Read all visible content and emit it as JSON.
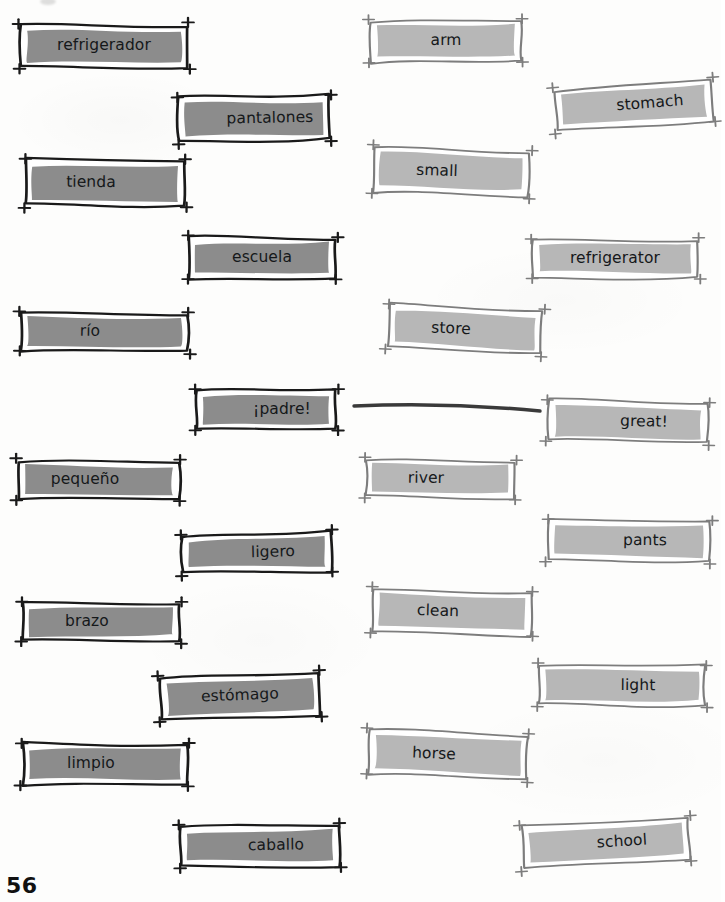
{
  "page": {
    "number": "56",
    "paper_color": "#fdfdfc",
    "spanish_card_fill": "#8c8c8c",
    "spanish_card_border": "#1a1a1a",
    "english_card_fill": "#b7b7b7",
    "english_card_border": "#7d7d7d",
    "card_inner_highlight": "#ffffff",
    "text_color": "#15181a",
    "match_line_color": "#3a3a3a"
  },
  "spanish_cards": [
    {
      "label": "refrigerador",
      "x": 10,
      "y": 16,
      "w": 188,
      "h": 60,
      "rot": 0,
      "text_shift": ""
    },
    {
      "label": "pantalones",
      "x": 168,
      "y": 88,
      "w": 172,
      "h": 62,
      "rot": -1.2,
      "text_shift": "shift-r"
    },
    {
      "label": "tienda",
      "x": 15,
      "y": 151,
      "w": 180,
      "h": 64,
      "rot": 0.4,
      "text_shift": "shift-l"
    },
    {
      "label": "escuela",
      "x": 178,
      "y": 229,
      "w": 168,
      "h": 58,
      "rot": 0,
      "text_shift": ""
    },
    {
      "label": "río",
      "x": 10,
      "y": 304,
      "w": 188,
      "h": 56,
      "rot": 0.6,
      "text_shift": "shift-l"
    },
    {
      "label": "¡padre!",
      "x": 186,
      "y": 382,
      "w": 160,
      "h": 56,
      "rot": 0,
      "text_shift": "shift-r"
    },
    {
      "label": "pequeño",
      "x": 8,
      "y": 452,
      "w": 182,
      "h": 56,
      "rot": 0,
      "text_shift": "shift-l"
    },
    {
      "label": "ligero",
      "x": 172,
      "y": 525,
      "w": 170,
      "h": 56,
      "rot": -1.4,
      "text_shift": "shift-r"
    },
    {
      "label": "brazo",
      "x": 12,
      "y": 594,
      "w": 178,
      "h": 56,
      "rot": 0,
      "text_shift": "shift-l"
    },
    {
      "label": "estómago",
      "x": 150,
      "y": 665,
      "w": 180,
      "h": 62,
      "rot": -2.2,
      "text_shift": ""
    },
    {
      "label": "limpio",
      "x": 12,
      "y": 735,
      "w": 186,
      "h": 58,
      "rot": 0,
      "text_shift": "shift-l"
    },
    {
      "label": "caballo",
      "x": 170,
      "y": 817,
      "w": 180,
      "h": 58,
      "rot": -0.8,
      "text_shift": "shift-r"
    }
  ],
  "english_cards": [
    {
      "label": "refrigerator",
      "x": 522,
      "y": 231,
      "w": 186,
      "h": 56,
      "rot": 0,
      "text_shift": ""
    },
    {
      "label": "arm",
      "x": 360,
      "y": 12,
      "w": 172,
      "h": 58,
      "rot": -0.4,
      "text_shift": ""
    },
    {
      "label": "stomach",
      "x": 545,
      "y": 75,
      "w": 178,
      "h": 60,
      "rot": -4.5,
      "text_shift": "shift-r"
    },
    {
      "label": "small",
      "x": 363,
      "y": 141,
      "w": 176,
      "h": 62,
      "rot": 2.0,
      "text_shift": "shift-l"
    },
    {
      "label": "store",
      "x": 378,
      "y": 299,
      "w": 174,
      "h": 62,
      "rot": 2.6,
      "text_shift": "shift-l"
    },
    {
      "label": "great!",
      "x": 538,
      "y": 393,
      "w": 180,
      "h": 58,
      "rot": 1.2,
      "text_shift": "shift-r"
    },
    {
      "label": "river",
      "x": 355,
      "y": 451,
      "w": 170,
      "h": 56,
      "rot": 0.6,
      "text_shift": "shift-l"
    },
    {
      "label": "pants",
      "x": 538,
      "y": 512,
      "w": 182,
      "h": 58,
      "rot": 0.4,
      "text_shift": "shift-r"
    },
    {
      "label": "clean",
      "x": 362,
      "y": 582,
      "w": 180,
      "h": 60,
      "rot": 1.6,
      "text_shift": "shift-l"
    },
    {
      "label": "light",
      "x": 528,
      "y": 657,
      "w": 188,
      "h": 58,
      "rot": 0.4,
      "text_shift": "shift-r"
    },
    {
      "label": "horse",
      "x": 358,
      "y": 724,
      "w": 180,
      "h": 62,
      "rot": 2.4,
      "text_shift": "shift-l"
    },
    {
      "label": "school",
      "x": 512,
      "y": 813,
      "w": 188,
      "h": 60,
      "rot": -3.6,
      "text_shift": "shift-r"
    }
  ],
  "match_line": {
    "name": "padre-to-great",
    "x1": 354,
    "y1": 406,
    "x2": 540,
    "y2": 411
  }
}
